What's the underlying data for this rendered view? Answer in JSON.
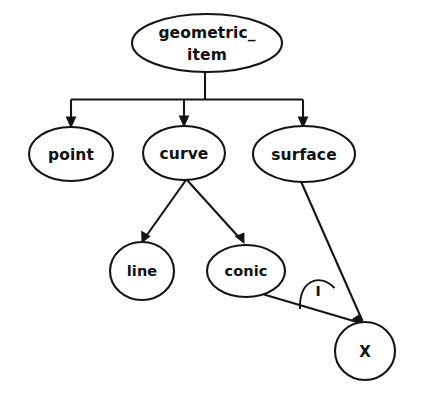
{
  "diagram": {
    "type": "entity-hierarchy-tree",
    "background_color": "#ffffff",
    "stroke_color": "#141414",
    "text_color": "#111111",
    "nodes": [
      {
        "id": "geometric_item",
        "label_line1": "geometric_",
        "label_line2": "item",
        "shape": "ellipse",
        "cx": 207,
        "cy": 43,
        "rx": 75,
        "ry": 29
      },
      {
        "id": "point",
        "label": "point",
        "shape": "ellipse",
        "cx": 71,
        "cy": 154,
        "rx": 42,
        "ry": 27
      },
      {
        "id": "curve",
        "label": "curve",
        "shape": "ellipse",
        "cx": 184,
        "cy": 153,
        "rx": 41,
        "ry": 27
      },
      {
        "id": "surface",
        "label": "surface",
        "shape": "ellipse",
        "cx": 304,
        "cy": 154,
        "rx": 51,
        "ry": 28
      },
      {
        "id": "line",
        "label": "line",
        "shape": "ellipse",
        "cx": 142,
        "cy": 271,
        "rx": 32,
        "ry": 29
      },
      {
        "id": "conic",
        "label": "conic",
        "shape": "ellipse",
        "cx": 246,
        "cy": 271,
        "rx": 39,
        "ry": 26
      },
      {
        "id": "x_node",
        "label": "X",
        "shape": "ellipse",
        "cx": 365,
        "cy": 351,
        "rx": 30,
        "ry": 29
      }
    ],
    "edges": [
      {
        "id": "edge-geometric_item-point",
        "from": "geometric_item",
        "to": "point",
        "style": "orthogonal",
        "arrow": true
      },
      {
        "id": "edge-geometric_item-curve",
        "from": "geometric_item",
        "to": "curve",
        "style": "orthogonal",
        "arrow": true
      },
      {
        "id": "edge-geometric_item-surface",
        "from": "geometric_item",
        "to": "surface",
        "style": "orthogonal",
        "arrow": true
      },
      {
        "id": "edge-curve-line",
        "from": "curve",
        "to": "line",
        "style": "straight",
        "arrow": true
      },
      {
        "id": "edge-curve-conic",
        "from": "curve",
        "to": "conic",
        "style": "straight",
        "arrow": true
      },
      {
        "id": "edge-surface-x",
        "from": "surface",
        "to": "x_node",
        "style": "straight",
        "arrow": true
      },
      {
        "id": "edge-conic-x",
        "from": "conic",
        "to": "x_node",
        "style": "straight",
        "arrow": true
      }
    ],
    "annotations": [
      {
        "id": "intersection-arc",
        "label": "I",
        "kind": "arc-between-edges",
        "between": [
          "edge-conic-x",
          "edge-surface-x"
        ],
        "label_x": 318,
        "label_y": 292
      }
    ]
  }
}
